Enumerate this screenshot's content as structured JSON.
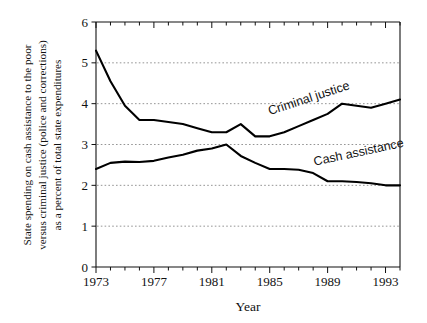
{
  "chart_data": {
    "type": "line",
    "title": "",
    "xlabel": "Year",
    "ylabel_lines": [
      "State spending on cash assistance to the poor",
      "versus criminal justice (police and corrections)",
      "as a percent of total state expenditures"
    ],
    "ylabel": "State spending on cash assistance to the poor versus criminal justice (police and corrections) as a percent of total state expenditures",
    "xlim": [
      1973,
      1994
    ],
    "ylim": [
      0,
      6
    ],
    "ytick_values": [
      0,
      1,
      2,
      3,
      4,
      5,
      6
    ],
    "ytick_labels": [
      "0",
      "1",
      "2",
      "3",
      "4",
      "5",
      "6"
    ],
    "xtick_values": [
      1973,
      1974,
      1975,
      1976,
      1977,
      1978,
      1979,
      1980,
      1981,
      1982,
      1983,
      1984,
      1985,
      1986,
      1987,
      1988,
      1989,
      1990,
      1991,
      1992,
      1993,
      1994
    ],
    "xtick_labeled": [
      1973,
      1977,
      1981,
      1985,
      1989,
      1993
    ],
    "xtick_labels": [
      "1973",
      "1977",
      "1981",
      "1985",
      "1989",
      "1993"
    ],
    "grid": "horizontal-dotted",
    "gridline_values": [
      1,
      2,
      3,
      4,
      5
    ],
    "legend_position": "inline-labels",
    "x": [
      1973,
      1974,
      1975,
      1976,
      1977,
      1978,
      1979,
      1980,
      1981,
      1982,
      1983,
      1984,
      1985,
      1986,
      1987,
      1988,
      1989,
      1990,
      1991,
      1992,
      1993,
      1994
    ],
    "series": [
      {
        "name": "Criminal justice",
        "label": "Criminal justice",
        "color": "#000000",
        "values": [
          5.3,
          4.55,
          3.95,
          3.6,
          3.6,
          3.55,
          3.5,
          3.4,
          3.3,
          3.3,
          3.5,
          3.2,
          3.2,
          3.3,
          3.45,
          3.6,
          3.75,
          4.0,
          3.95,
          3.9,
          4.0,
          4.1
        ]
      },
      {
        "name": "Cash assistance",
        "label": "Cash assistance",
        "color": "#000000",
        "values": [
          2.4,
          2.55,
          2.58,
          2.57,
          2.6,
          2.68,
          2.75,
          2.85,
          2.9,
          3.0,
          2.72,
          2.55,
          2.4,
          2.4,
          2.38,
          2.3,
          2.1,
          2.1,
          2.08,
          2.05,
          2.0,
          2.0
        ]
      }
    ],
    "annotations": [
      {
        "text": "Criminal justice",
        "x": 1985.0,
        "y": 3.72,
        "rotation": -18
      },
      {
        "text": "Cash assistance",
        "x": 1988.1,
        "y": 2.48,
        "rotation": -12
      }
    ]
  }
}
